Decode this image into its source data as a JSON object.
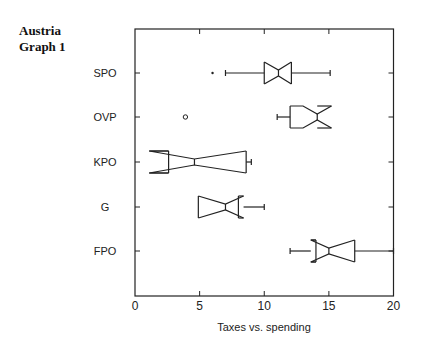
{
  "header": {
    "line1": "Austria",
    "line2": "Graph 1"
  },
  "chart_data": {
    "type": "boxplot",
    "title": "Austria Graph 1",
    "xlabel": "Taxes vs. spending",
    "ylabel": "",
    "xlim": [
      0,
      20
    ],
    "xticks": [
      0,
      5,
      10,
      15,
      20
    ],
    "orientation": "horizontal",
    "notched": true,
    "grid": false,
    "categories": [
      "SPO",
      "OVP",
      "KPO",
      "G",
      "FPO"
    ],
    "series": [
      {
        "name": "SPO",
        "whisker_low": 7.0,
        "q1": 10.0,
        "median": 11.1,
        "q3": 12.1,
        "whisker_high": 15.1,
        "notch_low": 10.0,
        "notch_high": 12.1,
        "outliers": [
          {
            "value": 6.0,
            "marker": "dot"
          }
        ]
      },
      {
        "name": "OVP",
        "whisker_low": 11.0,
        "q1": 12.0,
        "median": 14.1,
        "q3": 14.1,
        "whisker_high": 14.1,
        "notch_low": 13.0,
        "notch_high": 15.2,
        "outliers": [
          {
            "value": 3.9,
            "marker": "circle"
          }
        ]
      },
      {
        "name": "KPO",
        "whisker_low": 2.0,
        "q1": 2.6,
        "median": 4.6,
        "q3": 8.6,
        "whisker_high": 9.0,
        "notch_low": 1.1,
        "notch_high": 8.6,
        "outliers": []
      },
      {
        "name": "G",
        "whisker_low": 4.9,
        "q1": 4.9,
        "median": 7.0,
        "q3": 8.0,
        "whisker_high": 10.0,
        "notch_low": 4.9,
        "notch_high": 8.4,
        "outliers": []
      },
      {
        "name": "FPO",
        "whisker_low": 12.0,
        "q1": 14.0,
        "median": 15.0,
        "q3": 17.0,
        "whisker_high": 20.0,
        "notch_low": 13.6,
        "notch_high": 17.0,
        "outliers": []
      }
    ]
  }
}
